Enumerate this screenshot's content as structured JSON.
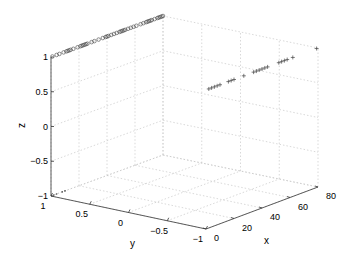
{
  "chart_data": {
    "type": "scatter3d",
    "title": "",
    "xlabel": "x",
    "ylabel": "y",
    "zlabel": "z",
    "xlim": [
      0,
      80
    ],
    "ylim": [
      -1,
      1
    ],
    "zlim": [
      -1,
      1
    ],
    "xticks": [
      "0",
      "20",
      "40",
      "60",
      "80"
    ],
    "yticks": [
      "1",
      "0.5",
      "0",
      "-0.5",
      "-1"
    ],
    "zticks": [
      "1",
      "0.5",
      "0",
      "-0.5",
      "-1"
    ],
    "grid": true,
    "series": [
      {
        "name": "circles",
        "marker": "o",
        "description": "points at y=1, z=1 spread along x",
        "x": [
          1,
          4,
          6,
          9,
          11,
          12,
          13,
          14,
          16,
          19,
          21,
          22,
          23,
          24,
          25,
          26,
          29,
          31,
          34,
          37,
          39,
          40,
          41,
          43,
          45,
          47,
          49,
          50,
          51,
          52,
          53,
          55,
          57,
          59,
          61,
          64,
          66,
          68,
          69,
          70,
          71,
          72,
          74,
          76,
          77,
          78,
          79,
          80
        ],
        "y": 1,
        "z": 1
      },
      {
        "name": "pluses",
        "marker": "+",
        "description": "points at y=-1, z=1 spread along x",
        "x": [
          2,
          4,
          6,
          8,
          10,
          16,
          18,
          20,
          27,
          34,
          36,
          38,
          40,
          42,
          44,
          52,
          54,
          56,
          58,
          62,
          79
        ],
        "y": -1,
        "z": 1
      },
      {
        "name": "dots",
        "marker": ".",
        "description": "few points near floor",
        "x": [
          2,
          4,
          8,
          10
        ],
        "y": 1,
        "z": -1
      }
    ]
  }
}
